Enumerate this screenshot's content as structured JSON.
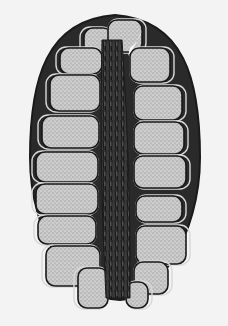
{
  "image": {
    "kind": "scanned grayscale micrograph illustration",
    "subject": "longitudinal section of an ellipsoid cone-like structure with central dark axis and stacked stippled segments on both sides",
    "width": 228,
    "height": 326
  },
  "colors": {
    "background": "#f3f3f3",
    "ink": "#1a1a1a",
    "segment_fill": "#cfcfcf",
    "segment_stipple": "#6e6e6e",
    "axis_dark": "#2b2b2b",
    "highlight": "#fafafa"
  },
  "outline": {
    "cx": 115,
    "top": 15,
    "bottom": 300,
    "half_width": 85
  },
  "axis": {
    "top_x": 112,
    "top_y": 40,
    "bottom_x": 118,
    "bottom_y": 298,
    "half_width_top": 10,
    "half_width_mid": 16,
    "half_width_bottom": 12
  },
  "segments_left": [
    {
      "x": 84,
      "y": 28,
      "w": 28,
      "h": 30
    },
    {
      "x": 60,
      "y": 48,
      "w": 42,
      "h": 26
    },
    {
      "x": 50,
      "y": 75,
      "w": 50,
      "h": 36
    },
    {
      "x": 42,
      "y": 116,
      "w": 57,
      "h": 32
    },
    {
      "x": 36,
      "y": 152,
      "w": 62,
      "h": 30
    },
    {
      "x": 36,
      "y": 184,
      "w": 62,
      "h": 30
    },
    {
      "x": 38,
      "y": 216,
      "w": 58,
      "h": 28
    },
    {
      "x": 46,
      "y": 246,
      "w": 54,
      "h": 40
    },
    {
      "x": 78,
      "y": 268,
      "w": 30,
      "h": 40
    }
  ],
  "segments_right": [
    {
      "x": 108,
      "y": 20,
      "w": 34,
      "h": 32
    },
    {
      "x": 130,
      "y": 48,
      "w": 40,
      "h": 34
    },
    {
      "x": 134,
      "y": 86,
      "w": 48,
      "h": 34
    },
    {
      "x": 134,
      "y": 122,
      "w": 50,
      "h": 32
    },
    {
      "x": 134,
      "y": 156,
      "w": 52,
      "h": 32
    },
    {
      "x": 136,
      "y": 196,
      "w": 46,
      "h": 26
    },
    {
      "x": 136,
      "y": 226,
      "w": 50,
      "h": 38
    },
    {
      "x": 134,
      "y": 262,
      "w": 34,
      "h": 32
    },
    {
      "x": 126,
      "y": 282,
      "w": 22,
      "h": 26
    }
  ]
}
